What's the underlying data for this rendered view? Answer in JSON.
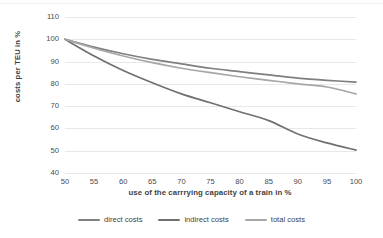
{
  "chart_data": {
    "type": "line",
    "title": "",
    "xlabel": "use of the carrrying capacity of a train in %",
    "ylabel": "costs per TEU in %",
    "xlim": [
      50,
      100
    ],
    "ylim": [
      40,
      110
    ],
    "xticks": [
      50,
      55,
      60,
      65,
      70,
      75,
      80,
      85,
      90,
      95,
      100
    ],
    "yticks": [
      40,
      50,
      60,
      70,
      80,
      90,
      100,
      110
    ],
    "grid": true,
    "legend_position": "bottom",
    "x": [
      50,
      55,
      60,
      65,
      70,
      75,
      80,
      85,
      90,
      95,
      100
    ],
    "series": [
      {
        "name": "direct costs",
        "color": "#7f7f7f",
        "values": [
          100,
          96.5,
          93.5,
          91.0,
          89.0,
          87.0,
          85.5,
          84.0,
          82.6,
          81.6,
          80.8
        ]
      },
      {
        "name": "indirect costs",
        "color": "#707070",
        "values": [
          100,
          92.5,
          86.0,
          80.5,
          75.5,
          71.5,
          67.5,
          63.5,
          57.5,
          53.5,
          50.3
        ]
      },
      {
        "name": "total costs",
        "color": "#a6a6a6",
        "values": [
          100,
          96.0,
          92.5,
          89.5,
          87.0,
          85.0,
          83.2,
          81.6,
          80.0,
          78.6,
          75.5
        ]
      }
    ]
  },
  "legend": {
    "items": [
      {
        "label": "direct costs"
      },
      {
        "label": "indirect costs"
      },
      {
        "label": "total costs"
      }
    ]
  },
  "colors": {
    "direct": "#7f7f7f",
    "indirect": "#707070",
    "total": "#a6a6a6",
    "grid": "#e8e8e8",
    "text": "#3f3f3f",
    "background": "#ffffff"
  }
}
